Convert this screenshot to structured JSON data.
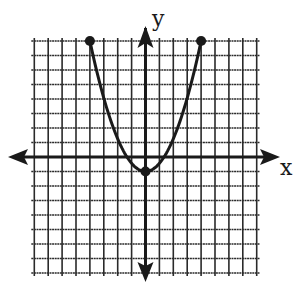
{
  "chart_data": {
    "type": "line",
    "title": "",
    "xlabel": "x",
    "ylabel": "y",
    "xlim": [
      -8,
      8
    ],
    "ylim": [
      -8,
      8
    ],
    "grid": true,
    "grid_step": 1,
    "legend": null,
    "function": "y = (9/16)x^2 - 1",
    "series": [
      {
        "name": "parabola",
        "x": [
          -4,
          -3,
          -2,
          -1,
          0,
          1,
          2,
          3,
          4
        ],
        "y": [
          8,
          4.0625,
          1.25,
          -0.4375,
          -1,
          -0.4375,
          1.25,
          4.0625,
          8
        ]
      }
    ],
    "points": [
      {
        "label": "left-endpoint",
        "x": -4,
        "y": 8
      },
      {
        "label": "vertex",
        "x": 0,
        "y": -1
      },
      {
        "label": "right-endpoint",
        "x": 4,
        "y": 8
      }
    ],
    "colors": {
      "line": "#1a1a1a",
      "grid": "#2a2a2a",
      "background": "#ffffff"
    }
  },
  "labels": {
    "x_axis": "x",
    "y_axis": "y"
  }
}
